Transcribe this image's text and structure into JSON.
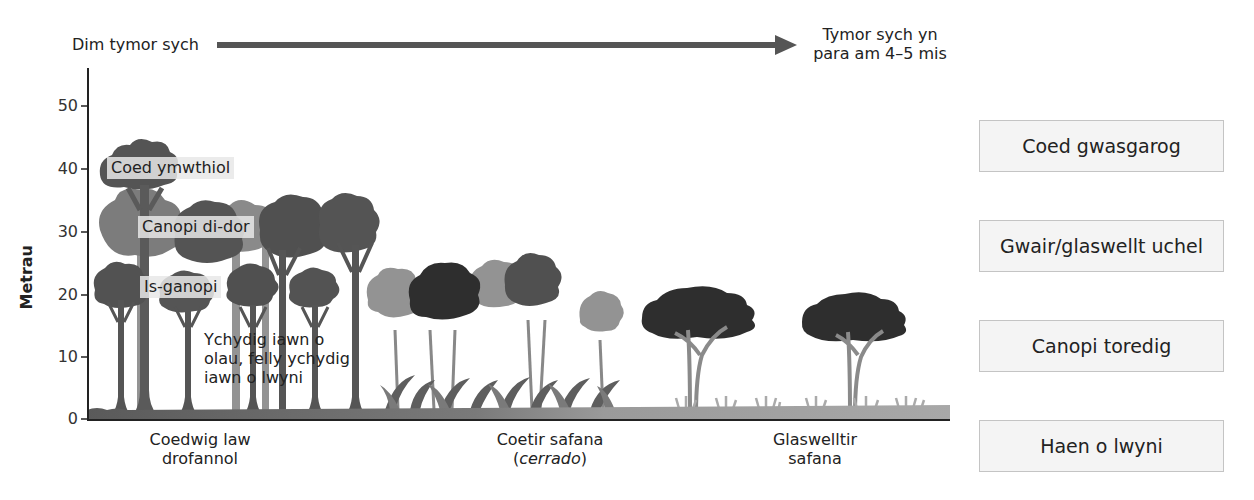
{
  "dry_season_arrow": {
    "start_label": "Dim tymor sych",
    "end_label_line1": "Tymor sych yn",
    "end_label_line2": "para am 4–5 mis",
    "color": "#555555"
  },
  "y_axis": {
    "title": "Metrau",
    "ticks": [
      "50",
      "40",
      "30",
      "20",
      "10",
      "0"
    ],
    "range": [
      0,
      55
    ]
  },
  "inline_labels": {
    "emergent": "Coed ymwthiol",
    "canopy": "Canopi di-dor",
    "understorey": "Is-ganopi",
    "note_line1": "Ychydig iawn o",
    "note_line2": "olau, felly ychydig",
    "note_line3": "iawn o lwyni"
  },
  "biomes": [
    {
      "line1": "Coedwig law",
      "line2": "drofannol",
      "italic": false
    },
    {
      "line1": "Coetir safana",
      "line2": "cerrado",
      "italic": true
    },
    {
      "line1": "Glaswelltir",
      "line2": "safana",
      "italic": false
    }
  ],
  "layer_boxes": [
    {
      "label": "Coed gwasgarog"
    },
    {
      "label": "Gwair/glaswellt uchel"
    },
    {
      "label": "Canopi toredig"
    },
    {
      "label": "Haen o lwyni"
    }
  ],
  "colors": {
    "tree_dark": "#4f4f4f",
    "tree_mid": "#6f6f6f",
    "tree_light": "#939393",
    "tree_darkest": "#2e2e2e",
    "ground_left": "#5a5a5a",
    "ground_right": "#a8a8a8",
    "label_box_bg": "#f4f4f4",
    "label_box_border": "#c4c4c4"
  }
}
